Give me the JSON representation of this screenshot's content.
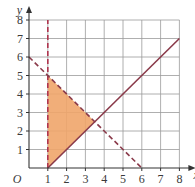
{
  "figure": {
    "x_axis_label": "x",
    "y_axis_label": "y",
    "origin_label": "O",
    "x_ticks": [
      "1",
      "2",
      "3",
      "4",
      "5",
      "6",
      "7",
      "8"
    ],
    "y_ticks": [
      "1",
      "2",
      "3",
      "4",
      "5",
      "6",
      "7",
      "8"
    ]
  },
  "lines": [
    {
      "name": "x = 1",
      "style": "dashed",
      "from": [
        1,
        0
      ],
      "to": [
        1,
        8
      ],
      "color": "#b0354f"
    },
    {
      "name": "x + y = 6",
      "style": "dashed",
      "from": [
        0,
        6
      ],
      "to": [
        6,
        0
      ],
      "color": "#8a3a4a"
    },
    {
      "name": "y = x - 1",
      "style": "solid",
      "from": [
        1,
        0
      ],
      "to": [
        8,
        7
      ],
      "color": "#8a3a4a"
    }
  ],
  "region": {
    "vertices": [
      [
        1,
        0
      ],
      [
        1,
        5
      ],
      [
        3.5,
        2.5
      ]
    ],
    "fill": "#f0a56a"
  },
  "colors": {
    "grid": "#9a9a9a",
    "axis": "#333333",
    "shade": "#f0a56a"
  }
}
